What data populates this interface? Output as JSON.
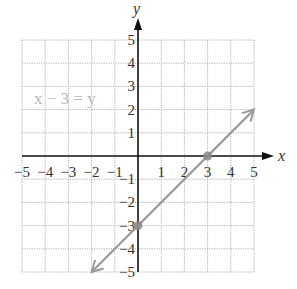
{
  "chart_data": {
    "type": "line",
    "title": "",
    "equation_label": "x − 3 = y",
    "xlabel": "x",
    "ylabel": "y",
    "xlim": [
      -5,
      5
    ],
    "ylim": [
      -5,
      5
    ],
    "grid": true,
    "x_ticks": [
      "−5",
      "−4",
      "−3",
      "−2",
      "−1",
      "1",
      "2",
      "3",
      "4",
      "5"
    ],
    "y_ticks": [
      "5",
      "4",
      "3",
      "2",
      "1",
      "−1",
      "−2",
      "−3",
      "−4",
      "−5"
    ],
    "series": [
      {
        "name": "x − 3 = y",
        "x": [
          -2,
          5
        ],
        "y": [
          -5,
          2
        ],
        "arrows": "both",
        "color": "#9a9a9a"
      }
    ],
    "points": [
      {
        "x": 3,
        "y": 0,
        "label": "x-intercept"
      },
      {
        "x": 0,
        "y": -3,
        "label": "y-intercept"
      }
    ],
    "colors": {
      "line": "#9a9a9a",
      "axis": "#111111",
      "grid": "#b0b0b0",
      "point": "#888888"
    }
  }
}
